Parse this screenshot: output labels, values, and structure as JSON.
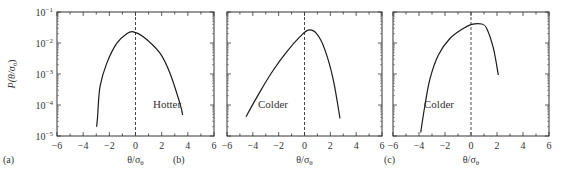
{
  "figure": {
    "ylabel_main": "P(θ/σ",
    "ylabel_sub": "θ",
    "ylabel_close": ")",
    "xlabel_main": "θ/σ",
    "xlabel_sub": "θ"
  },
  "chart_data": [
    {
      "type": "line",
      "panel": "(a)",
      "annotation": "Hotter",
      "xlabel": "θ/σθ",
      "ylabel": "P(θ/σθ)",
      "xlim": [
        -6,
        6
      ],
      "ylim": [
        1e-05,
        0.1
      ],
      "yscale": "log",
      "xticks": [
        -6,
        -4,
        -2,
        0,
        2,
        4,
        6
      ],
      "yticks": [
        "10^-5",
        "10^-4",
        "10^-3",
        "10^-2",
        "10^-1"
      ],
      "reference_line": {
        "x": 0,
        "style": "dashed"
      },
      "x": [
        -2.97,
        -2.9,
        -2.71,
        -2.2,
        -1.44,
        -0.67,
        -0.17,
        0.6,
        1.87,
        2.64,
        3.4,
        3.6
      ],
      "y": [
        2e-05,
        4.2e-05,
        0.00039,
        0.0022,
        0.0098,
        0.02,
        0.023,
        0.016,
        0.0047,
        0.00105,
        0.00011,
        4.8e-05
      ]
    },
    {
      "type": "line",
      "panel": "(b)",
      "annotation": "Colder",
      "xlabel": "θ/σθ",
      "xlim": [
        -6,
        6
      ],
      "ylim": [
        1e-05,
        0.1
      ],
      "yscale": "log",
      "xticks": [
        -6,
        -4,
        -2,
        0,
        2,
        4,
        6
      ],
      "reference_line": {
        "x": 0,
        "style": "dashed"
      },
      "x": [
        -4.53,
        -3.44,
        -2.41,
        -1.38,
        -0.35,
        0.3,
        0.94,
        1.59,
        2.23,
        2.75
      ],
      "y": [
        4.2e-05,
        0.00027,
        0.00135,
        0.0052,
        0.016,
        0.026,
        0.02,
        0.0059,
        0.00065,
        3.7e-05
      ]
    },
    {
      "type": "line",
      "panel": "(c)",
      "annotation": "Colder",
      "xlabel": "θ/σθ",
      "xlim": [
        -6,
        6
      ],
      "ylim": [
        1e-05,
        0.1
      ],
      "yscale": "log",
      "xticks": [
        -6,
        -4,
        -2,
        0,
        2,
        4,
        6
      ],
      "reference_line": {
        "x": 0,
        "style": "dashed"
      },
      "x": [
        -3.87,
        -3.54,
        -3.15,
        -2.51,
        -1.62,
        -0.59,
        0.05,
        0.82,
        1.21,
        1.72,
        2.1
      ],
      "y": [
        1.3e-05,
        0.0001,
        0.00072,
        0.0041,
        0.014,
        0.0295,
        0.04,
        0.041,
        0.0295,
        0.0068,
        0.00093
      ]
    }
  ]
}
